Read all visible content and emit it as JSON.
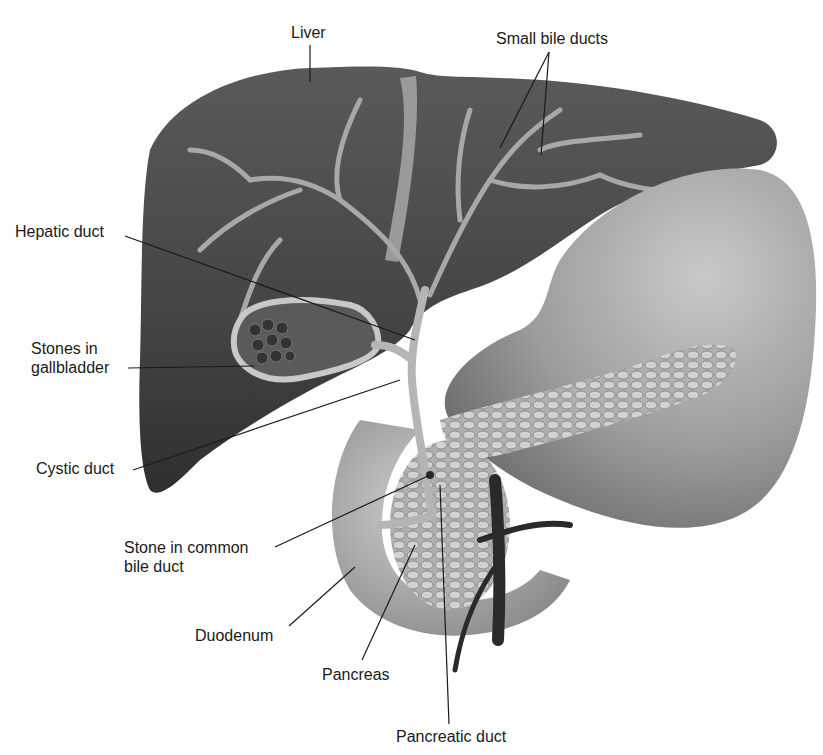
{
  "figure": {
    "type": "anatomical-illustration",
    "labels": {
      "liver": "Liver",
      "small_bile_ducts": "Small bile ducts",
      "hepatic_duct": "Hepatic duct",
      "stones_in_gallbladder": "Stones in\ngallbladder",
      "cystic_duct": "Cystic duct",
      "stone_in_common_bile_duct": "Stone in common\nbile duct",
      "duodenum": "Duodenum",
      "pancreas": "Pancreas",
      "pancreatic_duct": "Pancreatic duct"
    },
    "colors": {
      "liver": "#4a4a4a",
      "stomach": "#9a9a9a",
      "ducts": "#b8b8b8",
      "background": "#ffffff",
      "text": "#1a1a1a"
    }
  }
}
